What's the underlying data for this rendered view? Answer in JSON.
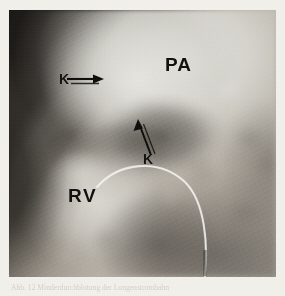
{
  "figure": {
    "kind": "angiogram-radiograph",
    "modality": "lateral right-ventricular angiogram",
    "labels": [
      {
        "id": "pa",
        "text": "PA",
        "meaning": "pulmonary artery",
        "x": 165,
        "y": 55
      },
      {
        "id": "rv",
        "text": "RV",
        "meaning": "right ventricle",
        "x": 68,
        "y": 186
      },
      {
        "id": "k1",
        "text": "K",
        "meaning": "annotation marker, upper arrow",
        "x": 59,
        "y": 72
      },
      {
        "id": "k2",
        "text": "K",
        "meaning": "annotation marker, lower arrow",
        "x": 143,
        "y": 152
      }
    ],
    "arrows": [
      {
        "id": "arrow-upper",
        "points_to": "pulmonary valve region",
        "direction": "right"
      },
      {
        "id": "arrow-lower",
        "points_to": "infundibular narrowing",
        "direction": "up-left"
      }
    ],
    "catheter": {
      "visible": true,
      "description": "thin radio-opaque catheter arc crossing the lower field"
    },
    "colors": {
      "dark_field": "#312d29",
      "mid_field": "#8d8a85",
      "bright_contrast": "#dedcd6",
      "label_ink": "#100e0c",
      "page_background": "#f3f1ec"
    },
    "geometry": {
      "page_width": 285,
      "page_height": 296,
      "image_left": 9,
      "image_top": 10,
      "image_width": 267,
      "image_height": 267
    }
  },
  "caption": {
    "text": "Abb. 12    Minderdurchblutung der Lungenstrombahn"
  }
}
